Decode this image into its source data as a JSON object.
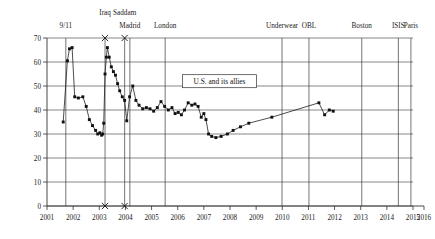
{
  "chart_data": {
    "type": "line",
    "title": "",
    "subtitle": "",
    "xlabel": "",
    "ylabel": "",
    "xlim": [
      2001,
      2016
    ],
    "ylim": [
      0,
      70
    ],
    "grid": true,
    "legend_position": "none",
    "xticks": [
      "2001",
      "2002",
      "2003",
      "2004",
      "2005",
      "2006",
      "2007",
      "2008",
      "2009",
      "2010",
      "2011",
      "2012",
      "2013",
      "2014",
      "2015",
      "2016"
    ],
    "yticks": [
      "0",
      "10",
      "20",
      "30",
      "40",
      "50",
      "60",
      "70"
    ],
    "annotations": [
      {
        "label": "9/11",
        "x": 2001.72,
        "marker": "none"
      },
      {
        "label": "Iraq",
        "x": 2003.22,
        "marker": "x"
      },
      {
        "label": "Saddam",
        "x": 2003.97,
        "marker": "x"
      },
      {
        "label": "Madrid",
        "x": 2004.17,
        "marker": "none"
      },
      {
        "label": "London",
        "x": 2005.52,
        "marker": "none"
      },
      {
        "label": "Underwear",
        "x": 2009.99,
        "marker": "none"
      },
      {
        "label": "OBL",
        "x": 2011.02,
        "marker": "none"
      },
      {
        "label": "Boston",
        "x": 2013.04,
        "marker": "none"
      },
      {
        "label": "ISIS",
        "x": 2014.44,
        "marker": "none"
      },
      {
        "label": "Paris",
        "x": 2014.92,
        "marker": "none"
      }
    ],
    "callout": {
      "text": "U.S. and its allies",
      "x": 2007.6,
      "y": 52
    },
    "series": [
      {
        "name": "U.S. and its allies",
        "points": [
          [
            2001.62,
            35.0
          ],
          [
            2001.78,
            60.5
          ],
          [
            2001.86,
            65.5
          ],
          [
            2001.96,
            66.0
          ],
          [
            2002.06,
            45.5
          ],
          [
            2002.2,
            45.0
          ],
          [
            2002.37,
            45.5
          ],
          [
            2002.5,
            41.5
          ],
          [
            2002.62,
            36.0
          ],
          [
            2002.74,
            33.5
          ],
          [
            2002.86,
            31.5
          ],
          [
            2002.94,
            30.0
          ],
          [
            2003.02,
            30.5
          ],
          [
            2003.09,
            29.5
          ],
          [
            2003.13,
            30.0
          ],
          [
            2003.17,
            34.5
          ],
          [
            2003.22,
            55.0
          ],
          [
            2003.27,
            62.0
          ],
          [
            2003.31,
            66.0
          ],
          [
            2003.38,
            62.0
          ],
          [
            2003.46,
            58.0
          ],
          [
            2003.54,
            56.0
          ],
          [
            2003.62,
            54.5
          ],
          [
            2003.7,
            51.0
          ],
          [
            2003.78,
            48.0
          ],
          [
            2003.88,
            45.5
          ],
          [
            2003.97,
            44.0
          ],
          [
            2004.05,
            35.5
          ],
          [
            2004.16,
            45.5
          ],
          [
            2004.28,
            50.0
          ],
          [
            2004.4,
            44.0
          ],
          [
            2004.52,
            42.0
          ],
          [
            2004.66,
            40.5
          ],
          [
            2004.8,
            41.0
          ],
          [
            2004.94,
            40.5
          ],
          [
            2005.08,
            39.5
          ],
          [
            2005.22,
            41.0
          ],
          [
            2005.36,
            43.5
          ],
          [
            2005.5,
            41.5
          ],
          [
            2005.64,
            40.0
          ],
          [
            2005.78,
            41.0
          ],
          [
            2005.9,
            38.5
          ],
          [
            2006.02,
            39.0
          ],
          [
            2006.14,
            38.0
          ],
          [
            2006.26,
            40.0
          ],
          [
            2006.4,
            43.0
          ],
          [
            2006.54,
            42.0
          ],
          [
            2006.66,
            42.5
          ],
          [
            2006.78,
            41.5
          ],
          [
            2006.9,
            37.0
          ],
          [
            2007.0,
            38.5
          ],
          [
            2007.08,
            36.0
          ],
          [
            2007.18,
            30.0
          ],
          [
            2007.3,
            29.0
          ],
          [
            2007.46,
            28.5
          ],
          [
            2007.66,
            29.0
          ],
          [
            2007.9,
            30.0
          ],
          [
            2008.12,
            31.5
          ],
          [
            2008.4,
            33.0
          ],
          [
            2008.72,
            34.5
          ],
          [
            2009.6,
            37.0
          ],
          [
            2011.4,
            43.0
          ],
          [
            2011.62,
            38.0
          ],
          [
            2011.8,
            40.0
          ],
          [
            2011.95,
            39.5
          ]
        ]
      }
    ]
  }
}
